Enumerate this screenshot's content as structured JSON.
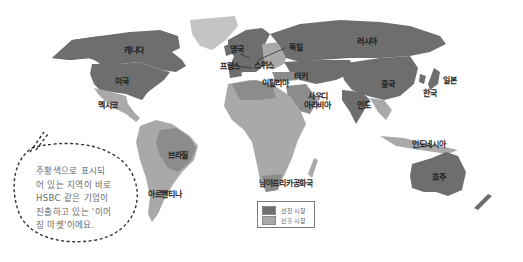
{
  "colors": {
    "developed": "#6e6e6e",
    "emerging": "#a9a9a9",
    "other_land": "#c9c9c9",
    "ocean": "#ffffff",
    "border": "#d8d8d8"
  },
  "countries": {
    "canada": "캐나다",
    "usa": "미국",
    "mexico": "멕시코",
    "brazil": "브라질",
    "argentina": "아르헨티나",
    "uk": "영국",
    "france": "프랑스",
    "germany": "독일",
    "switzerland": "스위스",
    "italy": "이탈리아",
    "russia": "러시아",
    "turkey": "터키",
    "saudi_arabia_1": "사우디",
    "saudi_arabia_2": "아라비아",
    "china": "중국",
    "india": "인도",
    "japan": "일본",
    "korea": "한국",
    "indonesia": "인도네시아",
    "australia": "호주",
    "south_africa": "남아프리카공화국"
  },
  "legend": {
    "developed_label": "선진 시장",
    "emerging_label": "신흥 시장"
  },
  "callout": {
    "lines": [
      "주황색으로 표시되",
      "어 있는 지역이 바로",
      "HSBC 같은 기업이",
      "진출하고 있는 '이머",
      "징 마켓'이에요."
    ]
  }
}
